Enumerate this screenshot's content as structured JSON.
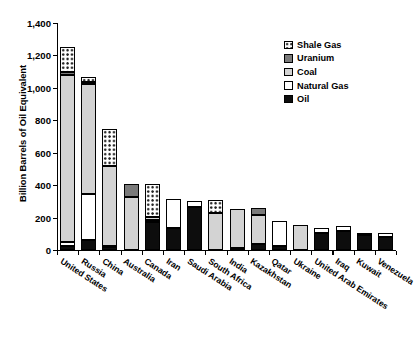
{
  "chart_data": {
    "type": "bar",
    "subtype": "stacked-bar",
    "title": "",
    "xlabel": "",
    "ylabel": "Billion Barrels of Oil Equivalent",
    "ylim": [
      0,
      1400
    ],
    "yticks": [
      "0",
      "200",
      "400",
      "600",
      "800",
      "1,000",
      "1,200",
      "1,400"
    ],
    "ytick_values": [
      0,
      200,
      400,
      600,
      800,
      1000,
      1200,
      1400
    ],
    "grid": false,
    "legend_position": "top-right",
    "categories": [
      "United States",
      "Russia",
      "China",
      "Australia",
      "Canada",
      "Iran",
      "Saudi Arabia",
      "South Africa",
      "India",
      "Kazakhstan",
      "Qatar",
      "Ukraine",
      "United Arab Emirates",
      "Iraq",
      "Kuwait",
      "Venezuela"
    ],
    "series": [
      {
        "name": "Oil",
        "color": "#0d0d0d",
        "pattern": "solid-black",
        "values": [
          22,
          63,
          20,
          0,
          175,
          135,
          265,
          0,
          8,
          35,
          25,
          0,
          105,
          120,
          95,
          80
        ]
      },
      {
        "name": "Natural Gas",
        "color": "#ffffff",
        "pattern": "solid-white",
        "values": [
          25,
          285,
          5,
          0,
          12,
          180,
          40,
          0,
          6,
          0,
          155,
          0,
          30,
          25,
          10,
          25
        ]
      },
      {
        "name": "Coal",
        "color": "#d3d3d3",
        "pattern": "solid-light-gray",
        "values": [
          1030,
          675,
          490,
          325,
          15,
          0,
          0,
          230,
          240,
          180,
          0,
          155,
          0,
          0,
          0,
          0
        ]
      },
      {
        "name": "Uranium",
        "color": "#7a7a7a",
        "pattern": "solid-dark-gray",
        "values": [
          20,
          12,
          0,
          85,
          0,
          0,
          0,
          0,
          0,
          45,
          0,
          0,
          0,
          0,
          0,
          0
        ]
      },
      {
        "name": "Shale Gas",
        "color": "#ffffff",
        "pattern": "checkered",
        "values": [
          158,
          30,
          230,
          0,
          205,
          0,
          0,
          80,
          0,
          0,
          0,
          0,
          0,
          0,
          0,
          0
        ]
      }
    ],
    "totals": [
      1255,
      1065,
      745,
      410,
      407,
      315,
      305,
      310,
      254,
      260,
      180,
      155,
      135,
      145,
      105,
      105
    ]
  },
  "legend": {
    "items": [
      {
        "label": "Shale Gas",
        "swatch": "sw-shale"
      },
      {
        "label": "Uranium",
        "swatch": "sw-uranium"
      },
      {
        "label": "Coal",
        "swatch": "sw-coal"
      },
      {
        "label": "Natural Gas",
        "swatch": "sw-gas"
      },
      {
        "label": "Oil",
        "swatch": "sw-oil"
      }
    ]
  }
}
